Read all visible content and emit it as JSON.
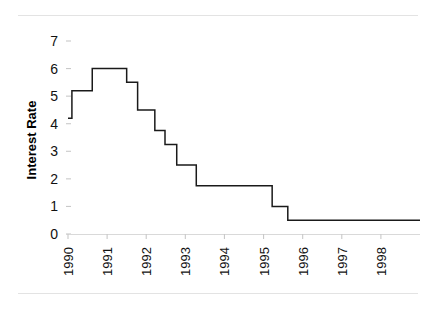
{
  "figure": {
    "background_color": "#ffffff",
    "rule_color": "#e3e3e3",
    "top_rule_name": "top-divider",
    "bottom_rule_name": "bottom-divider"
  },
  "chart_data": {
    "type": "line",
    "subtype": "step",
    "title": "",
    "subtitle": "",
    "xlabel": "",
    "ylabel": "Interest Rate",
    "xlim": [
      1990.0,
      1999.0
    ],
    "ylim": [
      0,
      7
    ],
    "grid": false,
    "legend": "none",
    "line_color": "#1a1a1a",
    "line_width": 1.5,
    "y_ticks": [
      0,
      1,
      2,
      3,
      4,
      5,
      6,
      7
    ],
    "y_tick_labels": [
      "0",
      "1",
      "2",
      "3",
      "4",
      "5",
      "6",
      "7"
    ],
    "x_ticks": [
      1990,
      1991,
      1992,
      1993,
      1994,
      1995,
      1996,
      1997,
      1998
    ],
    "x_tick_labels": [
      "1990",
      "1991",
      "1992",
      "1993",
      "1994",
      "1995",
      "1996",
      "1997",
      "1998"
    ],
    "x_tick_rotation_degrees": 90,
    "series": [
      {
        "name": "Interest Rate",
        "x": [
          1990.0,
          1990.1,
          1990.1,
          1990.62,
          1990.62,
          1991.5,
          1991.5,
          1991.78,
          1991.78,
          1992.22,
          1992.22,
          1992.48,
          1992.48,
          1992.78,
          1992.78,
          1993.28,
          1993.28,
          1993.62,
          1993.62,
          1995.22,
          1995.22,
          1995.62,
          1995.62,
          1999.0
        ],
        "y": [
          4.2,
          4.2,
          5.2,
          5.2,
          6.0,
          6.0,
          5.5,
          5.5,
          4.5,
          4.5,
          3.75,
          3.75,
          3.25,
          3.25,
          2.5,
          2.5,
          1.75,
          1.75,
          1.75,
          1.75,
          1.0,
          1.0,
          0.5,
          0.5
        ],
        "steps": [
          {
            "from_year": 1990.0,
            "to_year": 1990.1,
            "value": 4.2
          },
          {
            "from_year": 1990.1,
            "to_year": 1990.62,
            "value": 5.2
          },
          {
            "from_year": 1990.62,
            "to_year": 1991.5,
            "value": 6.0
          },
          {
            "from_year": 1991.5,
            "to_year": 1991.78,
            "value": 5.5
          },
          {
            "from_year": 1991.78,
            "to_year": 1992.22,
            "value": 4.5
          },
          {
            "from_year": 1992.22,
            "to_year": 1992.48,
            "value": 3.75
          },
          {
            "from_year": 1992.48,
            "to_year": 1992.78,
            "value": 3.25
          },
          {
            "from_year": 1992.78,
            "to_year": 1993.28,
            "value": 2.5
          },
          {
            "from_year": 1993.28,
            "to_year": 1995.22,
            "value": 1.75
          },
          {
            "from_year": 1995.22,
            "to_year": 1995.62,
            "value": 1.0
          },
          {
            "from_year": 1995.62,
            "to_year": 1999.0,
            "value": 0.5
          }
        ]
      }
    ]
  }
}
